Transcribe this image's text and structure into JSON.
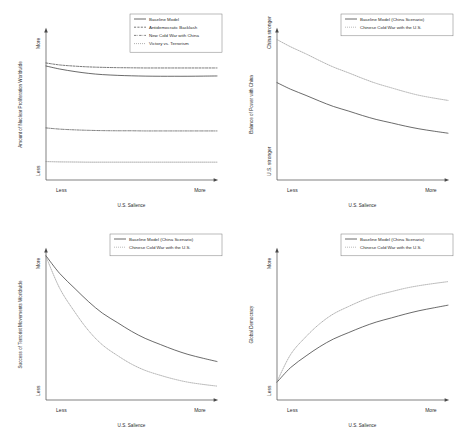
{
  "figure": {
    "layout": "2x2 grid of line charts",
    "panel_count": 4
  },
  "chart_data": [
    {
      "type": "line",
      "title": "",
      "xlabel": "U.S. Salience",
      "ylabel": "Amount of Nuclear Proliferation Worldwide",
      "xticklabels": [
        "Less",
        "More"
      ],
      "yticklabels": [
        "More",
        "Less"
      ],
      "xlim": [
        0,
        1
      ],
      "ylim": [
        0,
        1
      ],
      "grid": false,
      "legend_position": "top-right",
      "series": [
        {
          "name": "Baseline Model",
          "style": "solid",
          "color": "#3a3a3a",
          "x": [
            0.0,
            0.08,
            0.17,
            0.25,
            0.33,
            0.42,
            0.5,
            0.58,
            0.67,
            0.75,
            0.83,
            0.92,
            1.0
          ],
          "values": [
            0.755,
            0.735,
            0.718,
            0.706,
            0.698,
            0.693,
            0.69,
            0.688,
            0.687,
            0.687,
            0.687,
            0.688,
            0.689
          ]
        },
        {
          "name": "Antidemocratic Backlash",
          "style": "dashed",
          "color": "#4a4a4a",
          "x": [
            0.0,
            0.08,
            0.17,
            0.25,
            0.33,
            0.42,
            0.5,
            0.58,
            0.67,
            0.75,
            0.83,
            0.92,
            1.0
          ],
          "values": [
            0.775,
            0.762,
            0.754,
            0.749,
            0.746,
            0.744,
            0.743,
            0.742,
            0.742,
            0.742,
            0.742,
            0.742,
            0.742
          ]
        },
        {
          "name": "New Cold War with China",
          "style": "dashdot",
          "color": "#555555",
          "x": [
            0.0,
            0.08,
            0.17,
            0.25,
            0.33,
            0.42,
            0.5,
            0.58,
            0.67,
            0.75,
            0.83,
            0.92,
            1.0
          ],
          "values": [
            0.345,
            0.337,
            0.332,
            0.329,
            0.327,
            0.326,
            0.326,
            0.325,
            0.325,
            0.325,
            0.325,
            0.325,
            0.325
          ]
        },
        {
          "name": "Victory vs. Terrorism",
          "style": "dotted",
          "color": "#8a8a8a",
          "x": [
            0.0,
            0.08,
            0.17,
            0.25,
            0.33,
            0.42,
            0.5,
            0.58,
            0.67,
            0.75,
            0.83,
            0.92,
            1.0
          ],
          "values": [
            0.122,
            0.12,
            0.119,
            0.118,
            0.118,
            0.118,
            0.118,
            0.118,
            0.118,
            0.118,
            0.118,
            0.118,
            0.118
          ]
        }
      ]
    },
    {
      "type": "line",
      "title": "",
      "xlabel": "U.S. Salience",
      "ylabel": "Balance of Power with China",
      "xticklabels": [
        "Less",
        "More"
      ],
      "yticklabels": [
        "China stronger",
        "U.S. stronger"
      ],
      "xlim": [
        0,
        1
      ],
      "ylim": [
        0,
        1
      ],
      "grid": false,
      "legend_position": "top-right",
      "series": [
        {
          "name": "Baseline Model (China Scenario)",
          "style": "solid",
          "color": "#3a3a3a",
          "x": [
            0.0,
            0.08,
            0.17,
            0.25,
            0.33,
            0.42,
            0.5,
            0.58,
            0.67,
            0.75,
            0.83,
            0.92,
            1.0
          ],
          "values": [
            0.645,
            0.601,
            0.56,
            0.522,
            0.487,
            0.456,
            0.427,
            0.401,
            0.378,
            0.357,
            0.339,
            0.323,
            0.31
          ]
        },
        {
          "name": "Chinese Cold War with the U.S.",
          "style": "dotted",
          "color": "#9a9a9a",
          "x": [
            0.0,
            0.08,
            0.17,
            0.25,
            0.33,
            0.42,
            0.5,
            0.58,
            0.67,
            0.75,
            0.83,
            0.92,
            1.0
          ],
          "values": [
            0.93,
            0.882,
            0.835,
            0.79,
            0.748,
            0.709,
            0.673,
            0.64,
            0.61,
            0.584,
            0.561,
            0.542,
            0.527
          ]
        }
      ]
    },
    {
      "type": "line",
      "title": "",
      "xlabel": "U.S. Salience",
      "ylabel": "Success of Terrorist Movements Worldwide",
      "xticklabels": [
        "Less",
        "More"
      ],
      "yticklabels": [
        "More",
        "Less"
      ],
      "xlim": [
        0,
        1
      ],
      "ylim": [
        0,
        1
      ],
      "grid": false,
      "legend_position": "top-right",
      "series": [
        {
          "name": "Baseline Model (China Scenario)",
          "style": "solid",
          "color": "#3a3a3a",
          "x": [
            0.0,
            0.08,
            0.17,
            0.25,
            0.33,
            0.42,
            0.5,
            0.58,
            0.67,
            0.75,
            0.83,
            0.92,
            1.0
          ],
          "values": [
            0.955,
            0.838,
            0.737,
            0.65,
            0.575,
            0.511,
            0.455,
            0.408,
            0.367,
            0.332,
            0.302,
            0.276,
            0.255
          ]
        },
        {
          "name": "Chinese Cold War with the U.S.",
          "style": "dotted",
          "color": "#9a9a9a",
          "x": [
            0.0,
            0.08,
            0.17,
            0.25,
            0.33,
            0.42,
            0.5,
            0.58,
            0.67,
            0.75,
            0.83,
            0.92,
            1.0
          ],
          "values": [
            0.95,
            0.74,
            0.58,
            0.458,
            0.365,
            0.293,
            0.238,
            0.196,
            0.163,
            0.138,
            0.118,
            0.103,
            0.092
          ]
        }
      ]
    },
    {
      "type": "line",
      "title": "",
      "xlabel": "U.S. Salience",
      "ylabel": "Global Democracy",
      "xticklabels": [
        "Less",
        "More"
      ],
      "yticklabels": [
        "More",
        "Less"
      ],
      "xlim": [
        0,
        1
      ],
      "ylim": [
        0,
        1
      ],
      "grid": false,
      "legend_position": "top-right",
      "series": [
        {
          "name": "Baseline Model (China Scenario)",
          "style": "solid",
          "color": "#3a3a3a",
          "x": [
            0.0,
            0.08,
            0.17,
            0.25,
            0.33,
            0.42,
            0.5,
            0.58,
            0.67,
            0.75,
            0.83,
            0.92,
            1.0
          ],
          "values": [
            0.118,
            0.215,
            0.292,
            0.353,
            0.404,
            0.447,
            0.484,
            0.516,
            0.544,
            0.569,
            0.591,
            0.611,
            0.628
          ]
        },
        {
          "name": "Chinese Cold War with the U.S.",
          "style": "dotted",
          "color": "#9a9a9a",
          "x": [
            0.0,
            0.08,
            0.17,
            0.25,
            0.33,
            0.42,
            0.5,
            0.58,
            0.67,
            0.75,
            0.83,
            0.92,
            1.0
          ],
          "values": [
            0.122,
            0.302,
            0.42,
            0.505,
            0.57,
            0.62,
            0.66,
            0.692,
            0.718,
            0.74,
            0.757,
            0.772,
            0.784
          ]
        }
      ]
    }
  ]
}
